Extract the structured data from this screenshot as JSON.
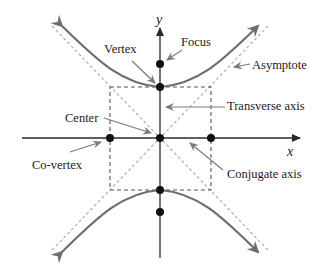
{
  "diagram": {
    "colors": {
      "axis": "#2a2a2a",
      "curve": "#6e6e6e",
      "asymptote": "#b0b0b0",
      "box": "#555555",
      "pointer": "#7a7a7a",
      "point": "#111111",
      "text": "#222222"
    },
    "axes": {
      "x_label": "x",
      "y_label": "y"
    },
    "labels": {
      "vertex": "Vertex",
      "focus": "Focus",
      "asymptote": "Asymptote",
      "center": "Center",
      "transverse_axis": "Transverse axis",
      "co_vertex": "Co-vertex",
      "conjugate_axis": "Conjugate axis"
    },
    "points": [
      {
        "name": "center"
      },
      {
        "name": "vertex-top"
      },
      {
        "name": "vertex-bottom"
      },
      {
        "name": "focus-top"
      },
      {
        "name": "focus-bottom"
      },
      {
        "name": "co-vertex-left"
      },
      {
        "name": "co-vertex-right"
      }
    ]
  }
}
